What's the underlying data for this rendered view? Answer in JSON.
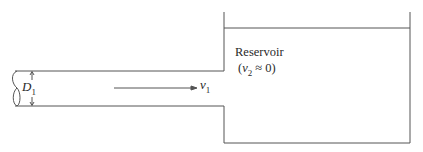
{
  "diagram": {
    "type": "pipe-into-reservoir",
    "pipe": {
      "diameter_label": "D",
      "diameter_subscript": "1",
      "velocity_label": "v",
      "velocity_subscript": "1"
    },
    "reservoir": {
      "title": "Reservoir",
      "condition_open": "(",
      "condition_var": "v",
      "condition_subscript": "2",
      "condition_rest": " ≈ 0)"
    },
    "colors": {
      "line": "#555555",
      "text": "#2a2a2a",
      "background": "#ffffff"
    }
  }
}
